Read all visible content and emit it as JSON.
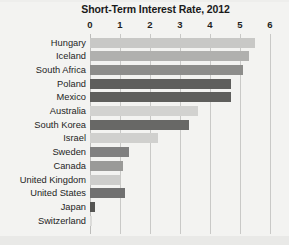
{
  "chart_data": {
    "type": "bar",
    "orientation": "horizontal",
    "title": "Short-Term Interest Rate, 2012",
    "xlabel": "",
    "ylabel": "",
    "xlim": [
      0,
      6
    ],
    "xticks": [
      "0",
      "1",
      "2",
      "3",
      "4",
      "5",
      "6"
    ],
    "xtick_values": [
      0,
      1,
      2,
      3,
      4,
      5,
      6
    ],
    "grid": true,
    "legend": false,
    "categories": [
      "Hungary",
      "Iceland",
      "South Africa",
      "Poland",
      "Mexico",
      "Australia",
      "South Korea",
      "Israel",
      "Sweden",
      "Canada",
      "United Kingdom",
      "United States",
      "Japan",
      "Switzerland"
    ],
    "values": [
      5.5,
      5.3,
      5.1,
      4.7,
      4.7,
      3.6,
      3.3,
      2.25,
      1.3,
      1.1,
      1.0,
      1.15,
      0.15,
      0.05
    ],
    "bar_colors": [
      "#c8c8c6",
      "#b0b0ae",
      "#8d8d8b",
      "#5e5e5c",
      "#5e5e5c",
      "#d2d2d0",
      "#686866",
      "#d0d0ce",
      "#808080",
      "#9a9a98",
      "#cdcdcb",
      "#707070",
      "#555553",
      "#dcdcda"
    ]
  },
  "colors": {
    "background": "#f3f3f1",
    "gridline": "#c9c9c7",
    "title_text": "#1a1a1a",
    "tick_text": "#1f1f1f",
    "category_text": "#242424"
  }
}
